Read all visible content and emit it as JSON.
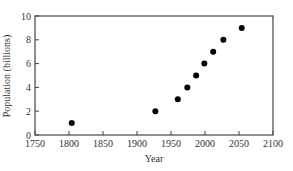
{
  "chart_data": {
    "type": "scatter",
    "title": "",
    "xlabel": "Year",
    "ylabel": "Population (billions)",
    "xlim": [
      1750,
      2100
    ],
    "ylim": [
      0,
      10
    ],
    "xticks": [
      1750,
      1800,
      1850,
      1900,
      1950,
      2000,
      2050,
      2100
    ],
    "yticks": [
      0,
      2,
      4,
      6,
      8,
      10
    ],
    "grid": false,
    "legend": null,
    "series": [
      {
        "name": "World population",
        "x": [
          1804,
          1927,
          1960,
          1974,
          1987,
          1999,
          2012,
          2027,
          2054
        ],
        "y": [
          1,
          2,
          3,
          4,
          5,
          6,
          7,
          8,
          9
        ]
      }
    ],
    "colors": {
      "marker": "#000000",
      "axis": "#444444",
      "text": "#333333"
    }
  }
}
